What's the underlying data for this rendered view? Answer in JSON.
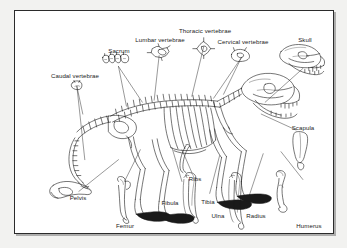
{
  "figure": {
    "border_color": "#2b2b2b",
    "background_color": "#ffffff",
    "page_color": "#f2f2f0",
    "ink_color": "#1a1a1a"
  },
  "labels": [
    {
      "id": "caudal-vertebrae",
      "text": "Caudal vertebrae",
      "x": 60,
      "y": 68,
      "align": "center"
    },
    {
      "id": "sacrum",
      "text": "Sacrum",
      "x": 104,
      "y": 42,
      "align": "center"
    },
    {
      "id": "lumbar-vertebrae",
      "text": "Lumbar vertebrae",
      "x": 145,
      "y": 31,
      "align": "center"
    },
    {
      "id": "thoracic-vertebrae",
      "text": "Thoracic vertebrae",
      "x": 190,
      "y": 22,
      "align": "center"
    },
    {
      "id": "cervical-vertebrae",
      "text": "Cervical vertebrae",
      "x": 228,
      "y": 33,
      "align": "center"
    },
    {
      "id": "skull",
      "text": "Skull",
      "x": 290,
      "y": 31,
      "align": "center"
    },
    {
      "id": "scapula",
      "text": "Scapula",
      "x": 288,
      "y": 113,
      "align": "center"
    },
    {
      "id": "pelvis",
      "text": "Pelvis",
      "x": 61,
      "y": 189,
      "align": "center"
    },
    {
      "id": "femur",
      "text": "Femur",
      "x": 110,
      "y": 216,
      "align": "center"
    },
    {
      "id": "ribs",
      "text": "Ribs",
      "x": 180,
      "y": 170,
      "align": "center"
    },
    {
      "id": "fibula",
      "text": "Fibula",
      "x": 155,
      "y": 194,
      "align": "center"
    },
    {
      "id": "tibia",
      "text": "Tibia",
      "x": 193,
      "y": 192,
      "align": "center"
    },
    {
      "id": "ulna",
      "text": "Ulna",
      "x": 203,
      "y": 206,
      "align": "center"
    },
    {
      "id": "radius",
      "text": "Radius",
      "x": 240,
      "y": 206,
      "align": "center"
    },
    {
      "id": "humerus",
      "text": "Humerus",
      "x": 294,
      "y": 216,
      "align": "center"
    }
  ],
  "insets": [
    {
      "id": "caudal-vertebra-inset",
      "shape": "single small vertebra, front view"
    },
    {
      "id": "sacrum-inset",
      "shape": "row of four fused vertebral segments"
    },
    {
      "id": "lumbar-vertebra-inset",
      "shape": "winged star-like vertebra, front view"
    },
    {
      "id": "thoracic-vertebra-inset",
      "shape": "diamond vertebra with tall spinous process"
    },
    {
      "id": "cervical-vertebra-inset",
      "shape": "broad arched vertebra, front view"
    },
    {
      "id": "skull-inset",
      "shape": "lateral skull with teeth and mandible"
    },
    {
      "id": "scapula-inset",
      "shape": "triangular shoulder blade"
    },
    {
      "id": "pelvis-inset",
      "shape": "hip bone with obturator foramen"
    },
    {
      "id": "femur-inset",
      "shape": "long thigh bone"
    },
    {
      "id": "ribs-inset",
      "shape": "single curved rib"
    },
    {
      "id": "tibia-fibula-inset",
      "shape": "tibia paired with slender fibula"
    },
    {
      "id": "ulna-radius-inset",
      "shape": "ulna paired with radius"
    },
    {
      "id": "humerus-inset",
      "shape": "upper arm bone"
    }
  ]
}
